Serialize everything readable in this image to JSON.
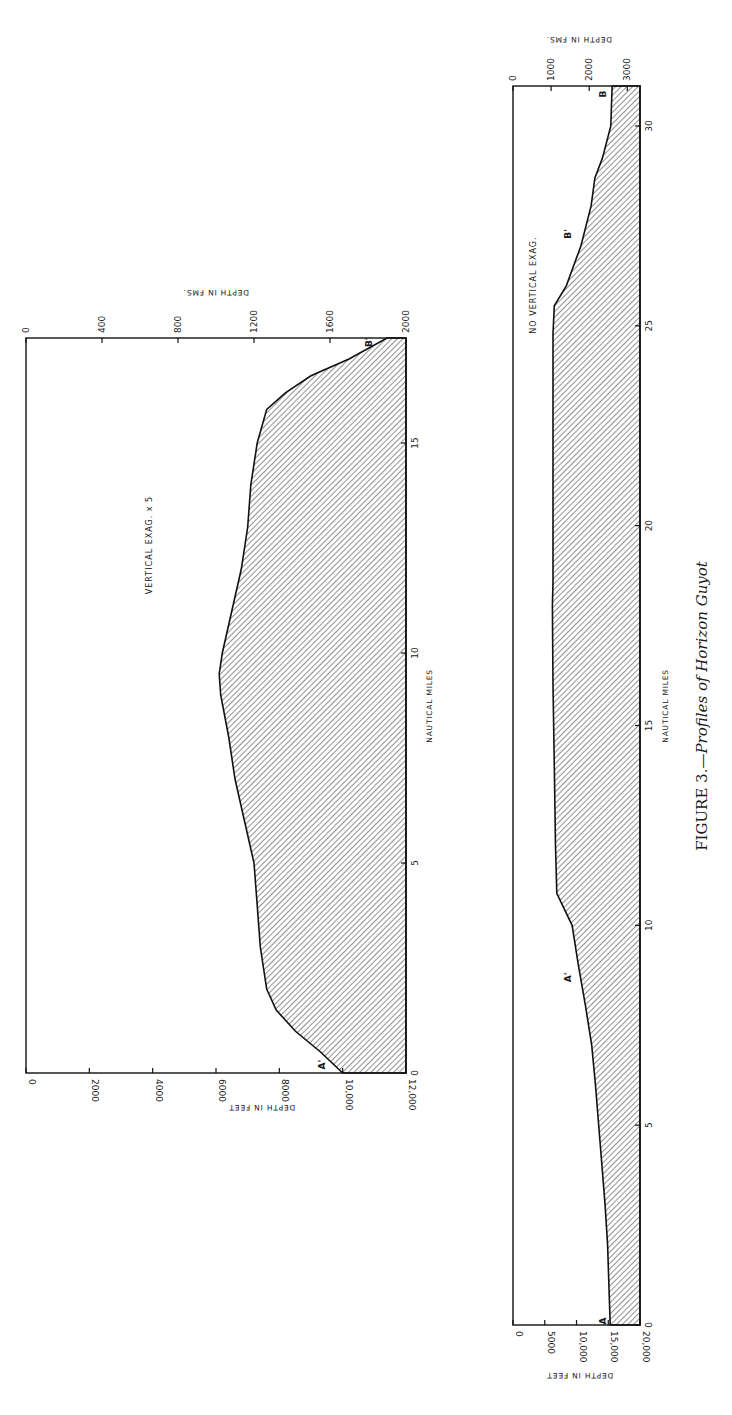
{
  "figure": {
    "caption_prefix": "FIGURE 3.—",
    "caption_title": "Profiles of Horizon Guyot",
    "orientation": "rotated 90° counter-clockwise"
  },
  "chart_data": [
    {
      "type": "area",
      "id": "profile-vertical-exaggeration",
      "title": "VERTICAL EXAG. x 5",
      "xlabel": "NAUTICAL MILES",
      "ylabel": "DEPTH IN FEET",
      "ylabel_secondary": "DEPTH IN FMS.",
      "x_ticks": [
        "0",
        "5",
        "10",
        "15"
      ],
      "y_ticks_feet": [
        "0",
        "2000",
        "4000",
        "6000",
        "8000",
        "10,000",
        "12,000"
      ],
      "y_ticks_fathoms": [
        "0",
        "400",
        "800",
        "1200",
        "1600",
        "2000"
      ],
      "xlim": [
        0,
        17.5
      ],
      "ylim_feet": [
        0,
        12000
      ],
      "y_inverted": true,
      "fill": "diagonal hatch",
      "labels": [
        {
          "text": "A'",
          "x": 0.2,
          "depth_ft": 9500
        },
        {
          "text": "B'",
          "x": 17.4,
          "depth_ft": 11000
        }
      ],
      "x": [
        0,
        0.5,
        1,
        1.5,
        2,
        3,
        4,
        5,
        6,
        7,
        8,
        9,
        9.5,
        10,
        11,
        12,
        13,
        14,
        15,
        15.8,
        16.2,
        16.6,
        17,
        17.5
      ],
      "values_ft": [
        10000,
        9300,
        8500,
        7900,
        7600,
        7400,
        7300,
        7200,
        6900,
        6600,
        6400,
        6150,
        6100,
        6200,
        6500,
        6800,
        7000,
        7100,
        7300,
        7600,
        8200,
        9000,
        10200,
        11400
      ]
    },
    {
      "type": "area",
      "id": "profile-no-vertical-exaggeration",
      "title": "NO VERTICAL EXAG.",
      "xlabel": "NAUTICAL MILES",
      "ylabel": "DEPTH IN FEET",
      "ylabel_secondary": "DEPTH IN FMS.",
      "x_ticks": [
        "0",
        "5",
        "10",
        "15",
        "20",
        "25",
        "30"
      ],
      "y_ticks_feet": [
        "0",
        "5000",
        "10,000",
        "15,000",
        "20,000"
      ],
      "y_ticks_fathoms": [
        "0",
        "1000",
        "2000",
        "3000"
      ],
      "xlim": [
        0,
        31
      ],
      "ylim_feet": [
        0,
        20000
      ],
      "y_inverted": true,
      "fill": "diagonal hatch",
      "labels": [
        {
          "text": "A",
          "x": 0.1,
          "depth_ft": 15000
        },
        {
          "text": "A'",
          "x": 8.7,
          "depth_ft": 9500
        },
        {
          "text": "B'",
          "x": 27.3,
          "depth_ft": 9500
        },
        {
          "text": "B",
          "x": 30.8,
          "depth_ft": 15000
        }
      ],
      "x": [
        0,
        1,
        2,
        3,
        4,
        5,
        6,
        7,
        8,
        9,
        10,
        10.8,
        12,
        14,
        16,
        18,
        18.6,
        20,
        22,
        24,
        24.8,
        25.5,
        26,
        27,
        28,
        28.7,
        29.2,
        30,
        31
      ],
      "values_ft": [
        15300,
        15100,
        14900,
        14500,
        14000,
        13500,
        13000,
        12400,
        11400,
        10300,
        9300,
        6900,
        6700,
        6500,
        6300,
        6200,
        6300,
        6300,
        6300,
        6300,
        6300,
        6500,
        8400,
        10700,
        12300,
        12900,
        14100,
        15400,
        15600
      ]
    }
  ]
}
